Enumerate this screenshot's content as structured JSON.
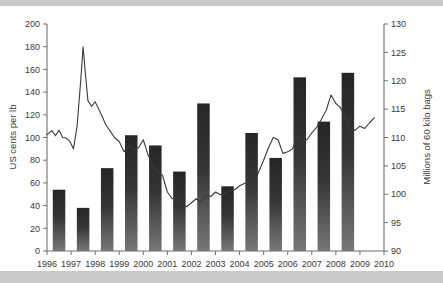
{
  "figure": {
    "background": "#c9c9c9",
    "plot_background": "#ffffff",
    "bar_color_top": "#2b2b2b",
    "bar_color_bottom": "#6e6e6e",
    "line_color": "#3a3a3a",
    "axis_color": "#707070",
    "partial_title_above": ""
  },
  "chart_data": {
    "type": "bar",
    "title": "",
    "subtitle": "",
    "xlabel": "",
    "ylabel": "US cents per lb",
    "y2label": "Millions of 60 kilo bags",
    "ylim": [
      0,
      200
    ],
    "y2lim": [
      90,
      130
    ],
    "yticks": [
      0,
      20,
      40,
      60,
      80,
      100,
      120,
      140,
      160,
      180,
      200
    ],
    "y2ticks": [
      90,
      95,
      100,
      105,
      110,
      115,
      120,
      125,
      130
    ],
    "xticks": [
      "1996",
      "1997",
      "1998",
      "1999",
      "2000",
      "2001",
      "2002",
      "2003",
      "2004",
      "2005",
      "2006",
      "2007",
      "2008",
      "2009",
      "2010"
    ],
    "grid": false,
    "legend": "none",
    "categories": [
      "1996",
      "1997",
      "1998",
      "1999",
      "2000",
      "2001",
      "2002",
      "2003",
      "2004",
      "2005",
      "2006",
      "2007",
      "2008"
    ],
    "values": [
      54,
      38,
      73,
      102,
      93,
      70,
      130,
      57,
      104,
      82,
      153,
      114,
      157
    ],
    "series": [
      {
        "name": "US cents per lb",
        "type": "bar",
        "axis": "left",
        "x": [
          "1996",
          "1997",
          "1998",
          "1999",
          "2000",
          "2001",
          "2002",
          "2003",
          "2004",
          "2005",
          "2006",
          "2007",
          "2008"
        ],
        "values": [
          54,
          38,
          73,
          102,
          93,
          70,
          130,
          57,
          104,
          82,
          153,
          114,
          157
        ]
      },
      {
        "name": "Millions of 60 kilo bags",
        "type": "line",
        "axis": "right",
        "x": [
          1996.0,
          1996.2,
          1996.35,
          1996.5,
          1996.65,
          1996.8,
          1996.95,
          1997.1,
          1997.25,
          1997.4,
          1997.5,
          1997.6,
          1997.7,
          1997.85,
          1998.0,
          1998.15,
          1998.3,
          1998.45,
          1998.6,
          1998.8,
          1999.0,
          1999.2,
          1999.4,
          1999.6,
          1999.8,
          2000.0,
          2000.2,
          2000.4,
          2000.6,
          2000.8,
          2001.0,
          2001.2,
          2001.4,
          2001.6,
          2001.8,
          2002.0,
          2002.2,
          2002.4,
          2002.6,
          2002.8,
          2003.0,
          2003.2,
          2003.4,
          2003.6,
          2003.8,
          2004.0,
          2004.2,
          2004.4,
          2004.6,
          2004.8,
          2005.0,
          2005.2,
          2005.4,
          2005.6,
          2005.8,
          2006.0,
          2006.2,
          2006.4,
          2006.6,
          2006.8,
          2007.0,
          2007.2,
          2007.4,
          2007.6,
          2007.8,
          2008.0,
          2008.2,
          2008.4,
          2008.6,
          2008.8,
          2009.0,
          2009.2,
          2009.4,
          2009.6
        ],
        "values": [
          110.5,
          111.2,
          110.3,
          111.3,
          110.0,
          109.9,
          109.3,
          108.0,
          112.0,
          120.0,
          126.0,
          121.0,
          116.5,
          115.5,
          116.3,
          115.0,
          113.6,
          112.2,
          111.3,
          110.0,
          109.3,
          107.5,
          108.5,
          107.9,
          108.2,
          109.6,
          106.9,
          105.0,
          104.0,
          103.3,
          100.4,
          99.2,
          99.5,
          98.4,
          97.8,
          98.5,
          99.2,
          98.6,
          99.8,
          99.6,
          100.4,
          99.9,
          100.2,
          100.6,
          100.8,
          101.5,
          101.9,
          102.2,
          102.0,
          104.0,
          106.0,
          108.2,
          110.0,
          109.6,
          107.2,
          107.5,
          108.0,
          110.1,
          109.4,
          109.6,
          110.8,
          111.8,
          113.2,
          114.8,
          117.5,
          116.0,
          115.2,
          113.6,
          111.0,
          111.3,
          112.0,
          111.6,
          112.6,
          113.5
        ]
      }
    ]
  },
  "axes": {
    "left": {
      "title": "US cents per lb",
      "labels": [
        "200",
        "180",
        "160",
        "140",
        "120",
        "100",
        "80",
        "60",
        "40",
        "20",
        "0"
      ]
    },
    "right": {
      "title": "Millions of 60 kilo bags",
      "labels": [
        "130",
        "125",
        "120",
        "115",
        "110",
        "105",
        "100",
        "95",
        "90"
      ]
    },
    "bottom": {
      "labels": [
        "1996",
        "1997",
        "1998",
        "1999",
        "2000",
        "2001",
        "2002",
        "2003",
        "2004",
        "2005",
        "2006",
        "2007",
        "2008",
        "2009",
        "2010"
      ]
    }
  }
}
